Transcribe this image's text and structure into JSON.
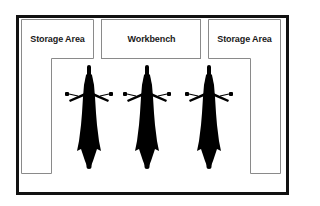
{
  "diagram": {
    "title": "",
    "zones": [
      {
        "id": "storage-left",
        "label": "Storage Area"
      },
      {
        "id": "workbench",
        "label": "Workbench"
      },
      {
        "id": "storage-right",
        "label": "Storage Area"
      }
    ],
    "motorcycles": [
      {
        "id": "motorcycle-1",
        "label": ""
      },
      {
        "id": "motorcycle-2",
        "label": ""
      },
      {
        "id": "motorcycle-3",
        "label": ""
      }
    ],
    "colors": {
      "frame": "#111111",
      "zone_outline": "#8a8a8a",
      "motorcycle": "#000000",
      "background": "#ffffff"
    }
  }
}
